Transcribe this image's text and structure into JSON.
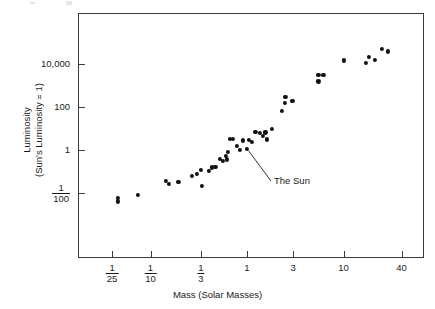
{
  "chart_data": {
    "type": "scatter",
    "title": "",
    "xlabel": "Mass (Solar Masses)",
    "ylabel_line1": "Luminosity",
    "ylabel_line2": "(Sun's Luminosity = 1)",
    "xscale": "log",
    "yscale": "log",
    "xlim": [
      0.022,
      60
    ],
    "ylim": [
      0.004,
      90000
    ],
    "grid": false,
    "legend": null,
    "xticks": [
      {
        "value": 0.04,
        "label_num": "1",
        "label_den": "25",
        "label": "1/25"
      },
      {
        "value": 0.1,
        "label_num": "1",
        "label_den": "10",
        "label": "1/10"
      },
      {
        "value": 0.3333,
        "label_num": "1",
        "label_den": "3",
        "label": "1/3"
      },
      {
        "value": 1,
        "label": "1"
      },
      {
        "value": 3,
        "label": "3"
      },
      {
        "value": 10,
        "label": "10"
      },
      {
        "value": 40,
        "label": "40"
      }
    ],
    "yticks": [
      {
        "value": 10000,
        "label": "10,000"
      },
      {
        "value": 100,
        "label": "100"
      },
      {
        "value": 1,
        "label": "1"
      },
      {
        "value": 0.01,
        "label_num": "1",
        "label_den": "100",
        "label": "1/100"
      }
    ],
    "points": [
      {
        "x": 0.046,
        "y": 0.006
      },
      {
        "x": 0.046,
        "y": 0.0042
      },
      {
        "x": 0.074,
        "y": 0.0085
      },
      {
        "x": 0.145,
        "y": 0.036
      },
      {
        "x": 0.155,
        "y": 0.026
      },
      {
        "x": 0.195,
        "y": 0.033
      },
      {
        "x": 0.27,
        "y": 0.062
      },
      {
        "x": 0.3,
        "y": 0.077
      },
      {
        "x": 0.335,
        "y": 0.12
      },
      {
        "x": 0.34,
        "y": 0.021
      },
      {
        "x": 0.4,
        "y": 0.105
      },
      {
        "x": 0.43,
        "y": 0.155
      },
      {
        "x": 0.47,
        "y": 0.16
      },
      {
        "x": 0.52,
        "y": 0.4
      },
      {
        "x": 0.56,
        "y": 0.3
      },
      {
        "x": 0.6,
        "y": 0.55
      },
      {
        "x": 0.62,
        "y": 0.37
      },
      {
        "x": 0.63,
        "y": 0.8
      },
      {
        "x": 0.66,
        "y": 3.2
      },
      {
        "x": 0.72,
        "y": 3.3
      },
      {
        "x": 0.78,
        "y": 1.5
      },
      {
        "x": 0.84,
        "y": 1.0
      },
      {
        "x": 0.9,
        "y": 2.8
      },
      {
        "x": 1.0,
        "y": 1.15,
        "label": "The Sun"
      },
      {
        "x": 1.05,
        "y": 2.9
      },
      {
        "x": 1.12,
        "y": 2.4
      },
      {
        "x": 1.22,
        "y": 7.0
      },
      {
        "x": 1.35,
        "y": 6.3
      },
      {
        "x": 1.45,
        "y": 4.6
      },
      {
        "x": 1.55,
        "y": 6.5
      },
      {
        "x": 1.62,
        "y": 3.1
      },
      {
        "x": 1.8,
        "y": 9.5
      },
      {
        "x": 2.3,
        "y": 62
      },
      {
        "x": 2.45,
        "y": 150
      },
      {
        "x": 2.5,
        "y": 280
      },
      {
        "x": 2.95,
        "y": 190
      },
      {
        "x": 5.5,
        "y": 3000
      },
      {
        "x": 5.5,
        "y": 1500
      },
      {
        "x": 6.2,
        "y": 3100
      },
      {
        "x": 10.0,
        "y": 14000
      },
      {
        "x": 17.0,
        "y": 11000
      },
      {
        "x": 18.5,
        "y": 21000
      },
      {
        "x": 21.0,
        "y": 15000
      },
      {
        "x": 25.0,
        "y": 48000
      },
      {
        "x": 29.0,
        "y": 37000
      }
    ],
    "annotations": [
      {
        "text": "The Sun",
        "target_x": 1.0,
        "target_y": 1.15
      }
    ]
  },
  "figure": {
    "background_color": "#ffffff",
    "axis_color": "#3a3a3a",
    "marker_color": "#111111",
    "text_color": "#1a1a1a"
  }
}
